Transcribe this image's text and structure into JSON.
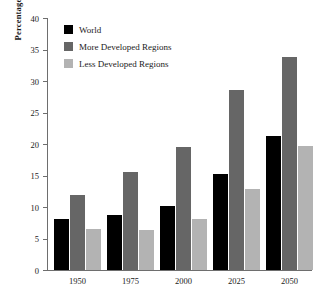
{
  "chart_data": {
    "type": "bar",
    "title": "",
    "subtitle": "",
    "xlabel": "",
    "ylabel": "Percentage",
    "categories": [
      "1950",
      "1975",
      "2000",
      "2025",
      "2050"
    ],
    "series": [
      {
        "name": "World",
        "color": "#000000",
        "values": [
          8.1,
          8.8,
          10.2,
          15.2,
          21.3
        ]
      },
      {
        "name": "More Developed Regions",
        "color": "#666666",
        "values": [
          11.9,
          15.6,
          19.6,
          28.5,
          33.8
        ]
      },
      {
        "name": "Less Developed Regions",
        "color": "#b3b3b3",
        "values": [
          6.5,
          6.4,
          8.1,
          12.8,
          19.7
        ]
      }
    ],
    "ylim": [
      0,
      40
    ],
    "ytick_labels": [
      "0",
      "5",
      "10",
      "15",
      "20",
      "25",
      "30",
      "35",
      "40"
    ],
    "ytick_values": [
      0,
      5,
      10,
      15,
      20,
      25,
      30,
      35,
      40
    ],
    "grid": false,
    "legend_position": "top-left",
    "axis_color": "#6e6e6e",
    "background": "#ffffff"
  }
}
